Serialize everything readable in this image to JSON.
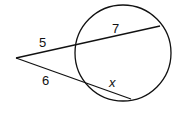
{
  "figure": {
    "type": "two-secants-from-external-point",
    "labels": {
      "upper_external": "5",
      "upper_internal": "7",
      "lower_external": "6",
      "lower_internal": "x"
    },
    "colors": {
      "stroke": "#111111",
      "background": "#ffffff"
    }
  }
}
